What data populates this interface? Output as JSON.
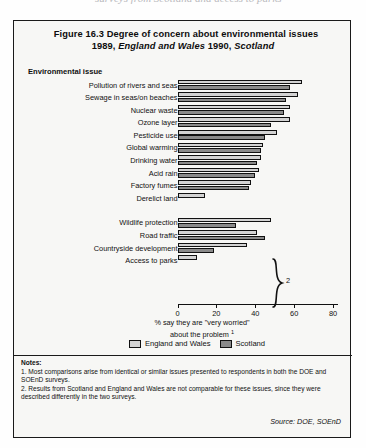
{
  "page_top_cutoff_text": "surveys from Scotland and access to parks",
  "figure": {
    "title_line1": "Figure 16.3   Degree of concern about environmental issues",
    "title_line2_prefix": "1989, ",
    "title_line2_italic1": "England and Wales",
    "title_line2_mid": "  1990, ",
    "title_line2_italic2": "Scotland",
    "category_axis_header": "Environmental issue",
    "axis_title_line1": "% say they are \"very worried\"",
    "axis_title_line2": "about the problem",
    "axis_title_footnote": "1",
    "brace_label": "2",
    "legend": [
      {
        "key": "ew",
        "label": "England and Wales",
        "color": "#d3d3d3"
      },
      {
        "key": "sc",
        "label": "Scotland",
        "color": "#8a8a8a"
      }
    ],
    "notes_heading": "Notes:",
    "note1": "1. Most comparisons arise from identical or similar issues presented to respondents in both the DOE and SOEnD surveys.",
    "note2": "2.  Results from Scotland and England and Wales are not comparable for these issues, since they were described differently in the two surveys.",
    "source": "Source: DOE, SOEnD"
  },
  "chart_data": {
    "type": "bar",
    "orientation": "horizontal",
    "title": "Figure 16.3  Degree of concern about environmental issues 1989, England and Wales  1990, Scotland",
    "xlabel": "% say they are \"very worried\" about the problem",
    "ylabel": "Environmental issue",
    "xlim": [
      0,
      85
    ],
    "xticks": [
      0,
      20,
      40,
      60,
      80
    ],
    "grid": false,
    "legend_position": "bottom",
    "categories": [
      "Pollution of rivers and seas",
      "Sewage in seas/on beaches",
      "Nuclear waste",
      "Ozone layer",
      "Pesticide use",
      "Global warming",
      "Drinking water",
      "Acid rain",
      "Factory fumes",
      "Derelict land",
      "Wildlife protection",
      "Road traffic",
      "Countryside development",
      "Access to parks"
    ],
    "group_breaks": [
      10
    ],
    "series": [
      {
        "name": "England and Wales",
        "color": "#d3d3d3",
        "values": [
          64,
          62,
          58,
          58,
          51,
          44,
          43,
          42,
          38,
          14,
          48,
          41,
          36,
          10
        ]
      },
      {
        "name": "Scotland",
        "color": "#8a8a8a",
        "values": [
          58,
          56,
          55,
          48,
          45,
          43,
          41,
          40,
          37,
          0,
          30,
          45,
          19,
          0
        ]
      }
    ]
  }
}
